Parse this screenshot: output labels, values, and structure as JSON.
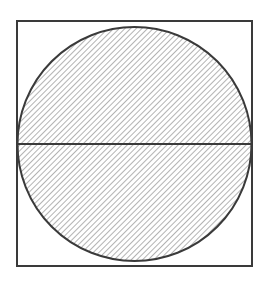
{
  "diagram": {
    "colors": {
      "background": "#ffffff",
      "stroke": "#3a3a3a",
      "hatch": "#8a8a8a"
    },
    "square": {
      "x": 17,
      "y": 21,
      "size": 235
    },
    "circle": {
      "cx": 134.5,
      "cy": 144,
      "r": 117
    },
    "diameter": {
      "x1": 17.5,
      "x2": 251.5,
      "y": 144
    }
  }
}
